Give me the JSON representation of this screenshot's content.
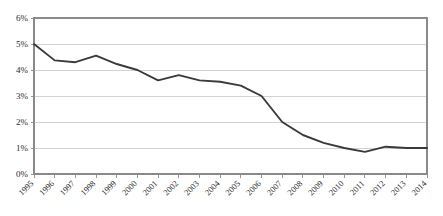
{
  "chart_data": {
    "type": "line",
    "title": "",
    "subtitle": "",
    "xlabel": "",
    "ylabel": "",
    "categories": [
      "1995",
      "1996",
      "1997",
      "1998",
      "1999",
      "2000",
      "2001",
      "2002",
      "2003",
      "2004",
      "2005",
      "2006",
      "2007",
      "2008",
      "2009",
      "2010",
      "2011",
      "2012",
      "2013",
      "2014"
    ],
    "series": [
      {
        "name": "",
        "values": [
          5.0,
          4.37,
          4.3,
          4.55,
          4.23,
          4.0,
          3.6,
          3.8,
          3.6,
          3.55,
          3.4,
          3.0,
          2.0,
          1.5,
          1.2,
          1.0,
          0.85,
          1.05,
          1.0,
          1.0
        ]
      }
    ],
    "ylim": [
      0,
      6
    ],
    "ytick_values": [
      0,
      1,
      2,
      3,
      4,
      5,
      6
    ],
    "ytick_labels": [
      "0%",
      "1%",
      "2%",
      "3%",
      "4%",
      "5%",
      "6%"
    ],
    "value_suffix": "%",
    "grid": true,
    "grid_axis": "y",
    "legend": false,
    "legend_position": "none",
    "colors": {
      "line": "#3a3a3a",
      "gridline": "#c8c8c8",
      "axis": "#8a8a8a",
      "text": "#2b2b2b",
      "background": "#ffffff"
    }
  },
  "plot": {
    "left": 34,
    "right": 427,
    "top": 18,
    "bottom": 174,
    "xtick_rotation": -45
  }
}
